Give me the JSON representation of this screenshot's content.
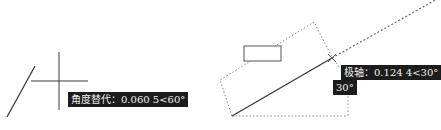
{
  "left_figure": {
    "tooltip": "角度替代：0.060 5<60°"
  },
  "right_figure": {
    "polar_tooltip": "极轴：0.124 4<30°",
    "angle_tooltip": "30°"
  },
  "colors": {
    "line": "#3a3a3a",
    "dotted": "#8a8a8a",
    "tooltip_bg": "#1c1c1c",
    "tooltip_text": "#f2f2f2"
  }
}
